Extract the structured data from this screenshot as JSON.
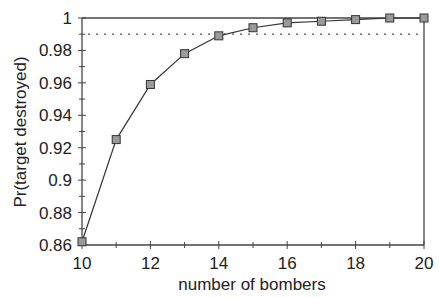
{
  "chart_data": {
    "type": "line",
    "title": "",
    "xlabel": "number of bombers",
    "ylabel": "Pr(target destroyed)",
    "x": [
      10,
      11,
      12,
      13,
      14,
      15,
      16,
      17,
      18,
      19,
      20
    ],
    "series": [
      {
        "name": "Pr(target destroyed)",
        "values": [
          0.862,
          0.925,
          0.959,
          0.978,
          0.989,
          0.994,
          0.997,
          0.998,
          0.999,
          1.0,
          1.0
        ],
        "marker": "square",
        "marker_color": "#9a9a9a",
        "line_color": "#333333"
      }
    ],
    "reference_lines": [
      {
        "y": 0.99,
        "style": "dotted",
        "color": "#555555"
      }
    ],
    "xlim": [
      10,
      20
    ],
    "ylim": [
      0.86,
      1.0
    ],
    "x_ticks": [
      "10",
      "12",
      "14",
      "16",
      "18",
      "20"
    ],
    "x_minor_ticks": [
      11,
      13,
      15,
      17,
      19
    ],
    "y_ticks": [
      "0.86",
      "0.88",
      "0.9",
      "0.92",
      "0.94",
      "0.96",
      "0.98",
      "1"
    ],
    "grid": false,
    "legend": "none"
  }
}
